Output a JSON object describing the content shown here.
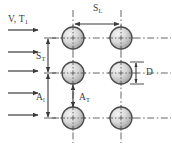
{
  "figure": {
    "kind": "tube-bank-staggered-array-schematic",
    "background_color": "#ffffff",
    "line_color": "#3a3a3a",
    "centerline_color": "#555555",
    "tube_fill_light": "#e8e8e8",
    "tube_fill_dark": "#9e9e9e",
    "tube_stroke": "#4a4a4a"
  },
  "labels": {
    "inlet": {
      "text": "V, T",
      "sub": "1"
    },
    "longitudinal_pitch": {
      "text": "S",
      "sub": "L"
    },
    "transverse_pitch": {
      "text": "S",
      "sub": "T"
    },
    "longitudinal_clearance": {
      "text": "A",
      "sub": "l"
    },
    "transverse_clearance": {
      "text": "A",
      "sub": "T"
    },
    "diameter": {
      "text": "D",
      "sub": ""
    }
  },
  "geometry": {
    "tube_radius": 11,
    "columns_x": [
      73,
      121
    ],
    "rows_y": [
      38,
      73,
      118
    ],
    "tubes": [
      {
        "name": "tube-col1-row1",
        "cx": 73,
        "cy": 38
      },
      {
        "name": "tube-col2-row1",
        "cx": 121,
        "cy": 38
      },
      {
        "name": "tube-col1-row2",
        "cx": 73,
        "cy": 73
      },
      {
        "name": "tube-col2-row2",
        "cx": 121,
        "cy": 73
      },
      {
        "name": "tube-col1-row3",
        "cx": 73,
        "cy": 118
      },
      {
        "name": "tube-col2-row3",
        "cx": 121,
        "cy": 118
      }
    ],
    "inlet_arrows_y": [
      30,
      52,
      71,
      93,
      115
    ],
    "inlet_arrow_x_start": 8,
    "inlet_arrow_x_end": 38
  },
  "dimensions": [
    {
      "name": "S_L",
      "orientation": "horizontal",
      "from": 73,
      "to": 121,
      "at": 24
    },
    {
      "name": "S_T",
      "orientation": "vertical",
      "from": 38,
      "to": 73,
      "at": 48
    },
    {
      "name": "A_l",
      "orientation": "vertical",
      "from": 73,
      "to": 118,
      "at": 48
    },
    {
      "name": "A_T",
      "orientation": "vertical",
      "from": 73,
      "to": 118,
      "at": 73
    },
    {
      "name": "D",
      "orientation": "vertical",
      "from": 62,
      "to": 84,
      "at": 136
    }
  ]
}
